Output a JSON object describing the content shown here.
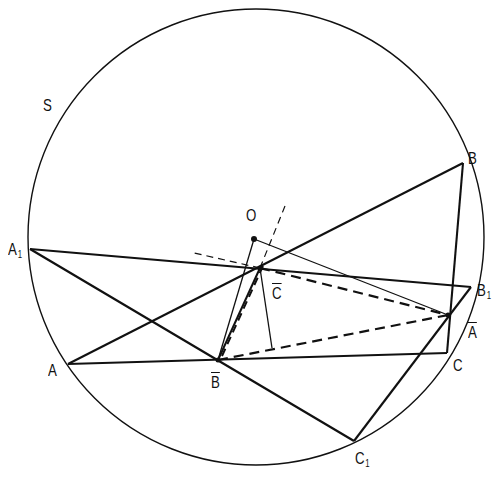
{
  "diagram": {
    "circle": {
      "label": "S",
      "cx": 256,
      "cy": 237,
      "r": 228
    },
    "points": {
      "A": {
        "label": "A",
        "sub": "",
        "x": 68,
        "y": 364
      },
      "B": {
        "label": "B",
        "sub": "",
        "x": 463,
        "y": 163
      },
      "C": {
        "label": "C",
        "sub": "",
        "x": 447,
        "y": 353
      },
      "A1": {
        "label": "A",
        "sub": "1",
        "x": 30,
        "y": 249
      },
      "B1": {
        "label": "B",
        "sub": "1",
        "x": 471,
        "y": 287
      },
      "C1": {
        "label": "C",
        "sub": "1",
        "x": 354,
        "y": 441
      },
      "O": {
        "label": "O",
        "sub": "",
        "x": 254,
        "y": 239
      },
      "Cbar": {
        "label": "C",
        "overbar": true,
        "x": 260,
        "y": 268
      },
      "Bbar": {
        "label": "B",
        "overbar": true,
        "x": 218,
        "y": 360
      },
      "Abar": {
        "label": "A",
        "overbar": true,
        "x": 448,
        "y": 315
      },
      "F": {
        "label": "",
        "x": 272,
        "y": 348
      }
    },
    "labels": {
      "S": "S",
      "A": "A",
      "B": "B",
      "C": "C",
      "A1_main": "A",
      "A1_sub": "1",
      "B1_main": "B",
      "B1_sub": "1",
      "C1_main": "C",
      "C1_sub": "1",
      "O": "O",
      "Cbar": "C",
      "Bbar": "B",
      "Abar": "A"
    },
    "segments_solid_thick": [
      [
        "A",
        "B"
      ],
      [
        "A",
        "C"
      ],
      [
        "B",
        "C"
      ],
      [
        "A1",
        "B1"
      ],
      [
        "A1",
        "C1"
      ],
      [
        "B1",
        "C1"
      ],
      [
        "Bbar",
        "Cbar"
      ]
    ],
    "segments_solid_thin": [
      [
        "O",
        "Bbar"
      ],
      [
        "O",
        "Abar"
      ],
      [
        "Cbar",
        "F"
      ]
    ],
    "segments_dashed_thick": [
      [
        "Cbar",
        "Abar"
      ],
      [
        "Bbar",
        "Abar"
      ],
      [
        "Bbar",
        "Cbar"
      ]
    ],
    "segments_dashed_thin": [
      [
        "Cbar",
        "ext_NE"
      ],
      [
        "Cbar",
        "ext_W"
      ]
    ],
    "extensions": {
      "ext_NE": {
        "x": 285,
        "y": 206
      },
      "ext_W": {
        "x": 190,
        "y": 252
      }
    },
    "colors": {
      "stroke": "#111111",
      "background": "#ffffff"
    }
  }
}
